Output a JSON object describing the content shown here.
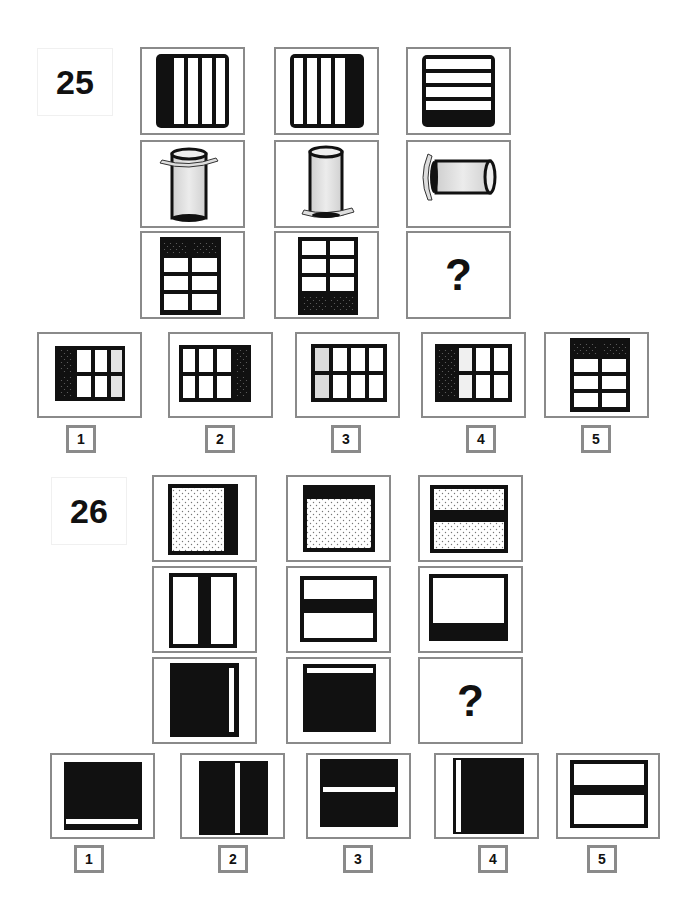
{
  "problems": [
    {
      "number": "25",
      "matrix": [
        [
          "vertical-stripes-left-black",
          "vertical-stripes-right-black",
          "horizontal-stripes-bottom-black"
        ],
        [
          "cylinder-rim-top",
          "cylinder-rim-bottom",
          "cylinder-rim-left-horizontal"
        ],
        [
          "grid-top-row-dotted",
          "grid-bottom-row-dotted",
          "?"
        ]
      ],
      "question_mark": "?",
      "options": [
        {
          "label": "1",
          "desc": "grid-left-column-dotted-right-gray"
        },
        {
          "label": "2",
          "desc": "grid-right-column-dotted"
        },
        {
          "label": "3",
          "desc": "grid-left-column-gray"
        },
        {
          "label": "4",
          "desc": "grid-left-column-dotted"
        },
        {
          "label": "5",
          "desc": "grid-top-row-dotted"
        }
      ]
    },
    {
      "number": "26",
      "matrix": [
        [
          "dotted-square-black-right-bar",
          "dotted-square-black-top-bar",
          "dotted-square-black-middle-bar"
        ],
        [
          "white-square-vertical-middle-bar",
          "white-square-horizontal-middle-bar",
          "white-square-black-bottom-bar"
        ],
        [
          "black-square-white-right-line",
          "black-square-white-top-line",
          "?"
        ]
      ],
      "question_mark": "?",
      "options": [
        {
          "label": "1",
          "desc": "black-square-white-bottom-line"
        },
        {
          "label": "2",
          "desc": "black-square-white-vertical-middle-line"
        },
        {
          "label": "3",
          "desc": "black-square-white-horizontal-middle-line"
        },
        {
          "label": "4",
          "desc": "black-square-white-left-line"
        },
        {
          "label": "5",
          "desc": "white-square-black-horizontal-middle-bar"
        }
      ]
    }
  ]
}
